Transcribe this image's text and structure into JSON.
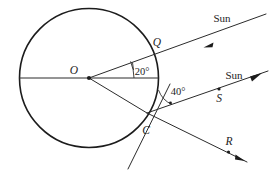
{
  "figure": {
    "background_color": "#ffffff",
    "stroke_color": "#1c1c1c",
    "width": 274,
    "height": 174
  },
  "labels": {
    "center_point": "O",
    "circle_point_q": "Q",
    "circle_point_c": "C",
    "ray_point_s": "S",
    "ray_point_r": "R",
    "sun_upper": "Sun",
    "sun_lower": "Sun",
    "angle_at_center": "20°",
    "angle_at_tangent": "40°"
  },
  "geometry": {
    "circle": {
      "cx": 89,
      "cy": 78,
      "r": 69.5
    },
    "center_dot": {
      "x": 89,
      "y": 78
    },
    "point_q": {
      "x": 155.5,
      "y": 54
    },
    "point_c": {
      "x": 147,
      "y": 113
    },
    "horizontal_radius_line": {
      "x1": 19.5,
      "y1": 78,
      "x2": 158.5,
      "y2": 78
    },
    "upper_sun_ray": {
      "x1": 89,
      "y1": 78,
      "x2": 266,
      "y2": 14
    },
    "lower_sun_ray": {
      "x1": 147,
      "y1": 113,
      "x2": 268,
      "y2": 71
    },
    "reflected_ray_r": {
      "x1": 147,
      "y1": 113,
      "x2": 247,
      "y2": 162
    },
    "tangent_line": {
      "x1": 170,
      "y1": 84,
      "x2": 128,
      "y2": 169
    },
    "oc_radius_line": {
      "x1": 89,
      "y1": 78,
      "x2": 147,
      "y2": 113
    },
    "angle_20_value": 20,
    "angle_40_value": 40
  },
  "icons": {
    "arrowhead_incoming": "arrow-left-down",
    "arrowhead_outgoing_sun": "arrow-right-up",
    "arrowhead_reflected": "arrow-right-down"
  }
}
